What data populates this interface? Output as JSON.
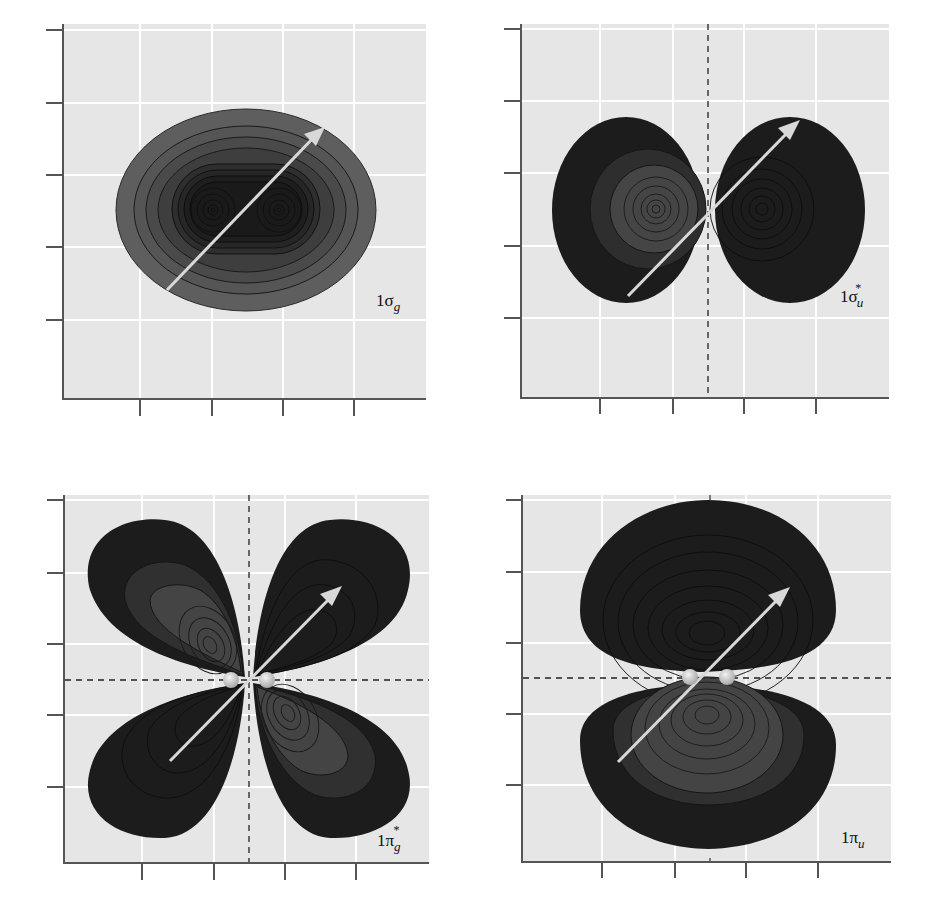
{
  "figure": {
    "colors": {
      "plot_background": "#e6e6e6",
      "grid": "#ffffff",
      "axis": "#555555",
      "lobe_dark": "#1c1c1c",
      "lobe_mid": "#3a3a3a",
      "lobe_light": "#555555",
      "lobe_lighter": "#626262",
      "sigma_g_outer": "#5e5e5e",
      "arrow": "#d8d8d8",
      "atom": "#c8c8c8",
      "contour": "#111111"
    },
    "panels": [
      {
        "id": "sigma_g",
        "label_main": "1σ",
        "label_sub": "g",
        "label_sup": "",
        "has_vertical_node": false,
        "has_horizontal_node": false,
        "has_atoms": false
      },
      {
        "id": "sigma_u_star",
        "label_main": "1σ",
        "label_sub": "u",
        "label_sup": "*",
        "has_vertical_node": true,
        "has_horizontal_node": false,
        "has_atoms": false
      },
      {
        "id": "pi_g_star",
        "label_main": "1π",
        "label_sub": "g",
        "label_sup": "*",
        "has_vertical_node": true,
        "has_horizontal_node": true,
        "has_atoms": true
      },
      {
        "id": "pi_u",
        "label_main": "1π",
        "label_sub": "u",
        "label_sup": "",
        "has_vertical_node": false,
        "has_horizontal_node": true,
        "has_atoms": true
      }
    ]
  }
}
